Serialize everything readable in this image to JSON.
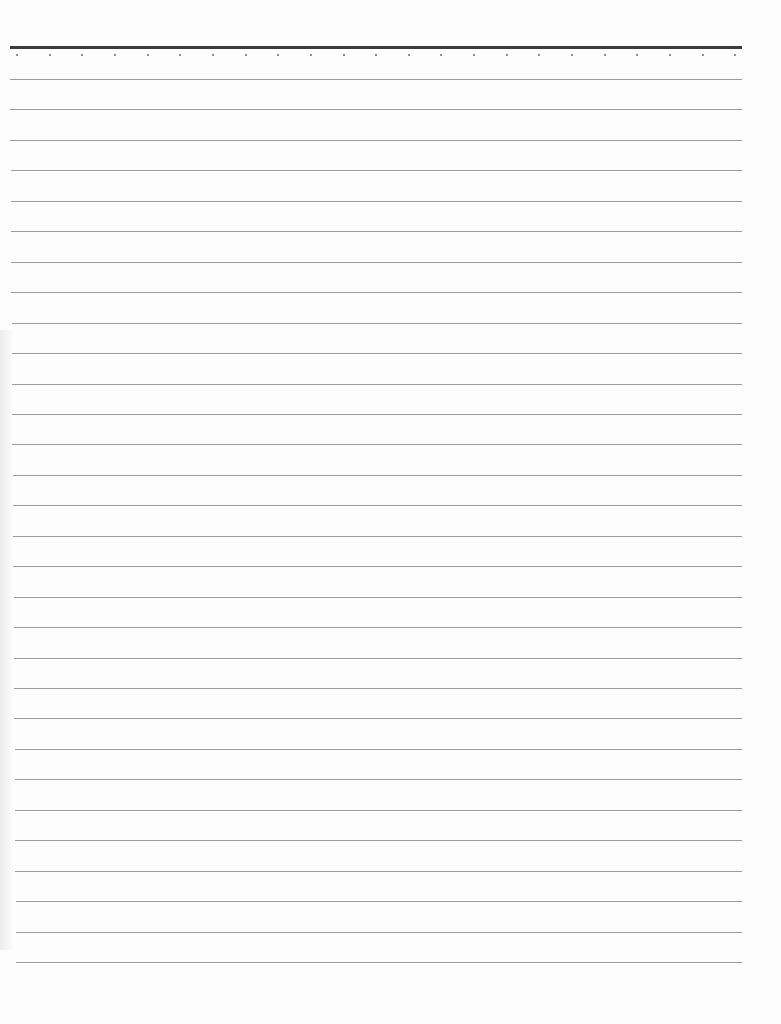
{
  "page": {
    "type": "lined notebook paper (blank)",
    "background_color": "#fdfdfd",
    "header_rule": {
      "y": 46,
      "x_start": 10,
      "x_end": 742,
      "thickness": 3,
      "color": "#3c3c3c"
    },
    "header_dots": {
      "count": 23,
      "y": 55,
      "x_start": 17,
      "spacing": 32.65,
      "color": "#6a6a6a"
    },
    "ruled_lines": {
      "count": 30,
      "first_y": 79,
      "spacing": 30.45,
      "x_start_top": 10,
      "x_start_bottom": 16,
      "x_end": 742,
      "color": "#9c9c9c"
    },
    "text_content": []
  }
}
